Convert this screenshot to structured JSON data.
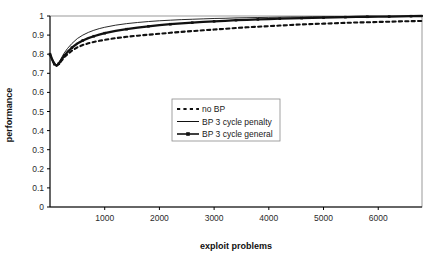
{
  "chart_data": {
    "type": "line",
    "title": "",
    "xlabel": "exploit problems",
    "ylabel": "performance",
    "xlim": [
      0,
      6800
    ],
    "ylim": [
      0,
      1
    ],
    "grid": false,
    "legend_position": "center",
    "xticks": [
      "1000",
      "2000",
      "3000",
      "4000",
      "5000",
      "6000"
    ],
    "xtick_values": [
      1000,
      2000,
      3000,
      4000,
      5000,
      6000
    ],
    "yticks": [
      "0",
      "0.1",
      "0.2",
      "0.3",
      "0.4",
      "0.5",
      "0.6",
      "0.7",
      "0.8",
      "0.9",
      "1"
    ],
    "ytick_values": [
      0,
      0.1,
      0.2,
      0.3,
      0.4,
      0.5,
      0.6,
      0.7,
      0.8,
      0.9,
      1
    ],
    "series": [
      {
        "name": "no BP",
        "style": "dotted",
        "color": "#111111",
        "x": [
          0,
          40,
          80,
          120,
          160,
          200,
          260,
          320,
          400,
          500,
          600,
          700,
          800,
          900,
          1000,
          1200,
          1400,
          1600,
          1800,
          2000,
          2200,
          2400,
          2600,
          2800,
          3000,
          3200,
          3400,
          3600,
          3800,
          4000,
          4200,
          4400,
          4600,
          4800,
          5000,
          5200,
          5400,
          5600,
          5800,
          6000,
          6200,
          6400,
          6600,
          6800
        ],
        "values": [
          0.8,
          0.772,
          0.748,
          0.74,
          0.748,
          0.762,
          0.784,
          0.8,
          0.818,
          0.836,
          0.848,
          0.857,
          0.864,
          0.87,
          0.875,
          0.884,
          0.891,
          0.897,
          0.902,
          0.907,
          0.912,
          0.917,
          0.921,
          0.925,
          0.929,
          0.933,
          0.937,
          0.941,
          0.944,
          0.947,
          0.95,
          0.953,
          0.956,
          0.958,
          0.96,
          0.962,
          0.964,
          0.966,
          0.967,
          0.969,
          0.97,
          0.972,
          0.973,
          0.974
        ]
      },
      {
        "name": "BP 3 cycle penalty",
        "style": "solid",
        "color": "#111111",
        "x": [
          0,
          40,
          80,
          120,
          160,
          200,
          260,
          320,
          400,
          500,
          600,
          700,
          800,
          900,
          1000,
          1200,
          1400,
          1600,
          1800,
          2000,
          2200,
          2400,
          2600,
          2800,
          3000,
          3200,
          3400,
          3600,
          3800,
          4000,
          4200,
          4400,
          4600,
          4800,
          5000,
          5200,
          5400,
          5600,
          5800,
          6000,
          6200,
          6400,
          6600,
          6800
        ],
        "values": [
          0.802,
          0.774,
          0.75,
          0.742,
          0.756,
          0.776,
          0.806,
          0.83,
          0.856,
          0.882,
          0.9,
          0.914,
          0.925,
          0.934,
          0.941,
          0.952,
          0.96,
          0.966,
          0.971,
          0.975,
          0.978,
          0.981,
          0.983,
          0.985,
          0.987,
          0.988,
          0.99,
          0.991,
          0.992,
          0.993,
          0.994,
          0.995,
          0.995,
          0.996,
          0.996,
          0.997,
          0.997,
          0.998,
          0.998,
          0.998,
          0.999,
          0.999,
          0.999,
          1.0
        ]
      },
      {
        "name": "BP 3 cycle general",
        "style": "solid-marker",
        "marker": "square",
        "color": "#111111",
        "x": [
          0,
          40,
          80,
          120,
          160,
          200,
          260,
          320,
          400,
          500,
          600,
          700,
          800,
          900,
          1000,
          1200,
          1400,
          1600,
          1800,
          2000,
          2200,
          2400,
          2600,
          2800,
          3000,
          3200,
          3400,
          3600,
          3800,
          4000,
          4200,
          4400,
          4600,
          4800,
          5000,
          5200,
          5400,
          5600,
          5800,
          6000,
          6200,
          6400,
          6600,
          6800
        ],
        "values": [
          0.8,
          0.772,
          0.748,
          0.74,
          0.75,
          0.766,
          0.792,
          0.812,
          0.834,
          0.856,
          0.872,
          0.884,
          0.894,
          0.903,
          0.91,
          0.922,
          0.931,
          0.939,
          0.946,
          0.952,
          0.957,
          0.961,
          0.965,
          0.969,
          0.972,
          0.975,
          0.978,
          0.98,
          0.982,
          0.984,
          0.986,
          0.988,
          0.989,
          0.99,
          0.991,
          0.993,
          0.994,
          0.995,
          0.996,
          0.997,
          0.997,
          0.998,
          0.999,
          1.0
        ]
      }
    ]
  },
  "legend": {
    "items": [
      {
        "label": "no BP"
      },
      {
        "label": "BP 3 cycle penalty"
      },
      {
        "label": "BP 3 cycle general"
      }
    ]
  },
  "colors": {
    "axis": "#000000",
    "plot_border": "#808080",
    "series": "#111111",
    "background": "#ffffff"
  }
}
